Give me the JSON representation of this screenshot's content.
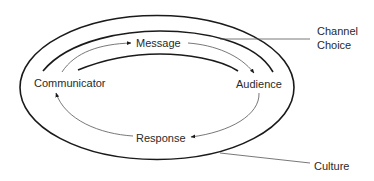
{
  "diagram": {
    "type": "communication-process-model",
    "nodes": {
      "communicator": "Communicator",
      "message": "Message",
      "audience": "Audience",
      "response": "Response"
    },
    "layers": {
      "channel_choice": [
        "Channel",
        "Choice"
      ],
      "culture": "Culture"
    },
    "flow": [
      {
        "from": "Communicator",
        "to": "Message"
      },
      {
        "from": "Message",
        "to": "Audience"
      },
      {
        "from": "Audience",
        "to": "Response"
      },
      {
        "from": "Response",
        "to": "Communicator"
      }
    ],
    "colors": {
      "thick_line": "#1a1a1a",
      "thin_line": "#555555",
      "text": "#2a2a2a",
      "background": "#ffffff"
    }
  }
}
